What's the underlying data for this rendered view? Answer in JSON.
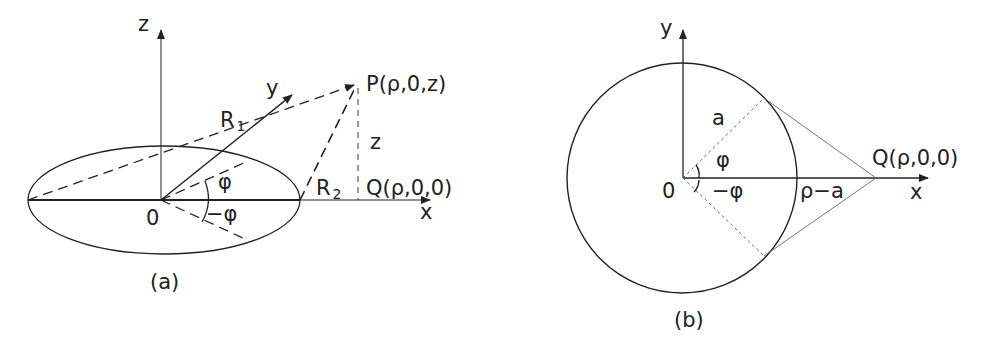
{
  "figure_a": {
    "caption": "(a)",
    "axis_z": "z",
    "axis_y": "y",
    "axis_x": "x",
    "origin": "0",
    "point_p": "P(ρ,0,z)",
    "point_q": "Q(ρ,0,0)",
    "r1": "R",
    "r1_sub": "1",
    "r2": "R",
    "r2_sub": "2",
    "height_z": "z",
    "angle_pos": "φ",
    "angle_neg": "−φ"
  },
  "figure_b": {
    "caption": "(b)",
    "axis_y": "y",
    "axis_x": "x",
    "origin": "0",
    "radius": "a",
    "point_q": "Q(ρ,0,0)",
    "distance": "ρ−a",
    "angle_pos": "φ",
    "angle_neg": "−φ"
  },
  "colors": {
    "stroke": "#222222",
    "dotted": "#555555"
  }
}
